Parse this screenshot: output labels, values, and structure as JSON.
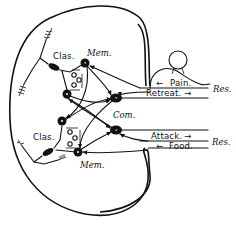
{
  "diagram": {
    "type": "neural schematic",
    "labels": {
      "clas_top": "Clas.",
      "mem_top": "Mem.",
      "com": "Com.",
      "clas_bottom": "Clas.",
      "mem_bottom": "Mem.",
      "pain": "Pain.",
      "retreat": "Retreat.",
      "res_top": "Res.",
      "attack": "Attack.",
      "food": "Food.",
      "res_bottom": "Res."
    },
    "arrows": {
      "pain": "←",
      "retreat": "→",
      "attack": "→",
      "food": "←"
    },
    "colors": {
      "ink": "#111111",
      "background": "#ffffff"
    }
  }
}
